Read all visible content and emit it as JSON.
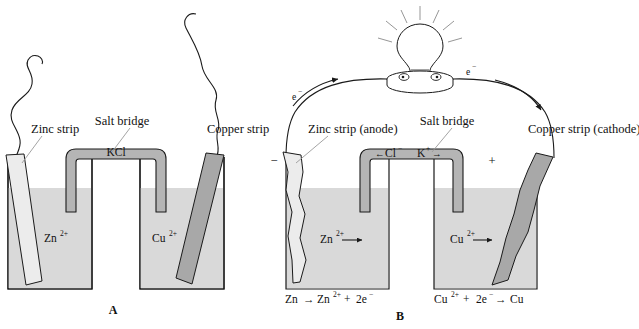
{
  "figure": {
    "type": "diagram"
  },
  "colors": {
    "solution_fill": "#d9d9d9",
    "zinc_strip_fill": "#ececec",
    "copper_strip_fill": "#a8a8a8",
    "salt_bridge_fill": "#b5b5b5",
    "outline": "#1a1a1a",
    "leader_line": "#9a9a9a",
    "ray": "#8a8a8a",
    "background": "#ffffff"
  },
  "panel_a": {
    "panel_label": "A",
    "labels": {
      "zinc_strip": "Zinc strip",
      "salt_bridge": "Salt bridge",
      "copper_strip": "Copper strip",
      "salt_bridge_contents": "KCl"
    },
    "left_beaker": {
      "ion": "Zn",
      "charge": "2+"
    },
    "right_beaker": {
      "ion": "Cu",
      "charge": "2+"
    }
  },
  "panel_b": {
    "panel_label": "B",
    "labels": {
      "zinc_strip": "Zinc strip (anode)",
      "salt_bridge": "Salt bridge",
      "copper_strip": "Copper strip (cathode)"
    },
    "electrode_signs": {
      "anode": "−",
      "cathode": "+"
    },
    "electron_labels": {
      "left": "e",
      "left_charge": "−",
      "right": "e",
      "right_charge": "−"
    },
    "salt_bridge_ions": {
      "anion_arrow": "←",
      "anion": "Cl",
      "anion_charge": "−",
      "cation": "K",
      "cation_charge": "+",
      "cation_arrow": "→"
    },
    "left_beaker": {
      "ion": "Zn",
      "charge": "2+",
      "migration_arrow": "→"
    },
    "right_beaker": {
      "ion": "Cu",
      "charge": "2+",
      "migration_arrow": "→"
    },
    "equations": {
      "oxidation": {
        "reactant": "Zn",
        "arrow": "→",
        "product": "Zn",
        "product_charge": "2+",
        "plus": "+",
        "electrons": "2e",
        "electron_charge": "−"
      },
      "reduction": {
        "reactant": "Cu",
        "reactant_charge": "2+",
        "plus": "+",
        "electrons": "2e",
        "electron_charge": "−",
        "arrow": "→",
        "product": "Cu"
      }
    },
    "bulb": {
      "name": "light-bulb",
      "lit": true
    }
  }
}
